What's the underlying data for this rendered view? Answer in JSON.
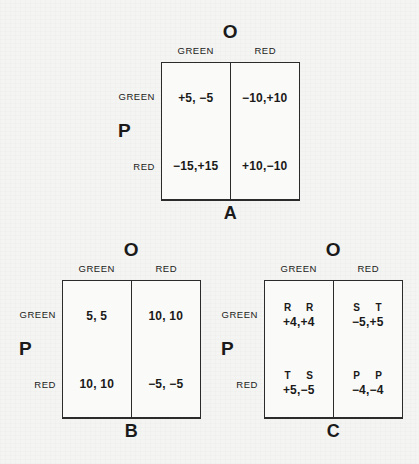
{
  "page": {
    "background_color": "#f4f4f2",
    "ink_color": "#1a1a1a",
    "edge_mark_left": "",
    "edge_mark_right": ""
  },
  "figures": [
    {
      "id": "A",
      "label": "A",
      "column_player": "O",
      "row_player": "P",
      "column_headers": [
        "GREEN",
        "RED"
      ],
      "row_headers": [
        "GREEN",
        "RED"
      ],
      "cells": [
        [
          {
            "strategy": [
              "",
              ""
            ],
            "payoff": "+5, −5"
          },
          {
            "strategy": [
              "",
              ""
            ],
            "payoff": "−10,+10"
          }
        ],
        [
          {
            "strategy": [
              "",
              ""
            ],
            "payoff": "−15,+15"
          },
          {
            "strategy": [
              "",
              ""
            ],
            "payoff": "+10,−10"
          }
        ]
      ]
    },
    {
      "id": "B",
      "label": "B",
      "column_player": "O",
      "row_player": "P",
      "column_headers": [
        "GREEN",
        "RED"
      ],
      "row_headers": [
        "GREEN",
        "RED"
      ],
      "cells": [
        [
          {
            "strategy": [
              "",
              ""
            ],
            "payoff": "5, 5"
          },
          {
            "strategy": [
              "",
              ""
            ],
            "payoff": "10, 10"
          }
        ],
        [
          {
            "strategy": [
              "",
              ""
            ],
            "payoff": "10, 10"
          },
          {
            "strategy": [
              "",
              ""
            ],
            "payoff": "−5, −5"
          }
        ]
      ]
    },
    {
      "id": "C",
      "label": "C",
      "column_player": "O",
      "row_player": "P",
      "column_headers": [
        "GREEN",
        "RED"
      ],
      "row_headers": [
        "GREEN",
        "RED"
      ],
      "cells": [
        [
          {
            "strategy": [
              "R",
              "R"
            ],
            "payoff": "+4,+4"
          },
          {
            "strategy": [
              "S",
              "T"
            ],
            "payoff": "−5,+5"
          }
        ],
        [
          {
            "strategy": [
              "T",
              "S"
            ],
            "payoff": "+5,−5"
          },
          {
            "strategy": [
              "P",
              "P"
            ],
            "payoff": "−4,−4"
          }
        ]
      ]
    }
  ]
}
